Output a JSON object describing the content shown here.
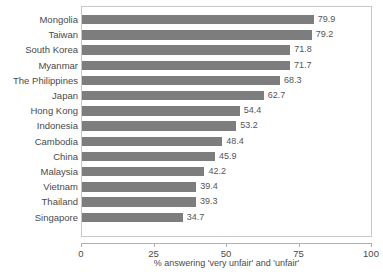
{
  "chart_data": {
    "type": "bar",
    "orientation": "horizontal",
    "title": "",
    "subtitle": "",
    "xlabel": "% answering 'very unfair' and 'unfair'",
    "ylabel": "",
    "xlim": [
      0,
      100
    ],
    "xticks": [
      "0",
      "25",
      "50",
      "75",
      "100"
    ],
    "xtick_values": [
      0,
      25,
      50,
      75,
      100
    ],
    "grid": false,
    "legend": null,
    "bar_color": "#7d7d7d",
    "plot_border_color": "#c8c8c8",
    "background_color": "#ffffff",
    "categories": [
      "Mongolia",
      "Taiwan",
      "South Korea",
      "Myanmar",
      "The Philippines",
      "Japan",
      "Hong Kong",
      "Indonesia",
      "Cambodia",
      "China",
      "Malaysia",
      "Vietnam",
      "Thailand",
      "Singapore"
    ],
    "values": [
      79.9,
      79.2,
      71.8,
      71.7,
      68.3,
      62.7,
      54.4,
      53.2,
      48.4,
      45.9,
      42.2,
      39.4,
      39.3,
      34.7
    ],
    "value_labels": [
      "79.9",
      "79.2",
      "71.8",
      "71.7",
      "68.3",
      "62.7",
      "54.4",
      "53.2",
      "48.4",
      "45.9",
      "42.2",
      "39.4",
      "39.3",
      "34.7"
    ]
  }
}
